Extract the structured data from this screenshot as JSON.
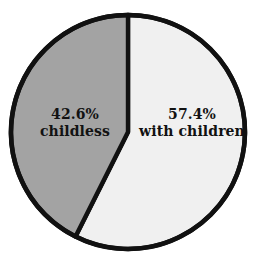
{
  "figure": {
    "background_color": "#ffffff",
    "outline_color": "#111111"
  },
  "chart_data": {
    "type": "pie",
    "title": "",
    "subtitle": "",
    "xlabel": "",
    "ylabel": "",
    "grid": false,
    "legend_position": "none",
    "start_angle_deg": 90,
    "direction": "counterclockwise",
    "units": "percent",
    "total": 100.0,
    "categories": [
      "childless",
      "with children"
    ],
    "values": [
      42.6,
      57.4
    ],
    "slices": [
      {
        "label": "childless",
        "value": 42.6,
        "value_text": "42.6%",
        "color": "#a3a3a3",
        "edge_color": "#111111",
        "label_position": "inside-left"
      },
      {
        "label": "with children",
        "value": 57.4,
        "value_text": "57.4%",
        "color": "#f0f0f0",
        "edge_color": "#111111",
        "label_position": "inside-right"
      }
    ],
    "annotations": [
      {
        "text": "42.6%",
        "target": "childless"
      },
      {
        "text": "childless",
        "target": "childless"
      },
      {
        "text": "57.4%",
        "target": "with children"
      },
      {
        "text": "with children",
        "target": "with children"
      }
    ]
  },
  "labels": {
    "childless": {
      "value_text": "42.6%",
      "name_text": "childless"
    },
    "with_children": {
      "value_text": "57.4%",
      "name_text": "with children"
    }
  }
}
